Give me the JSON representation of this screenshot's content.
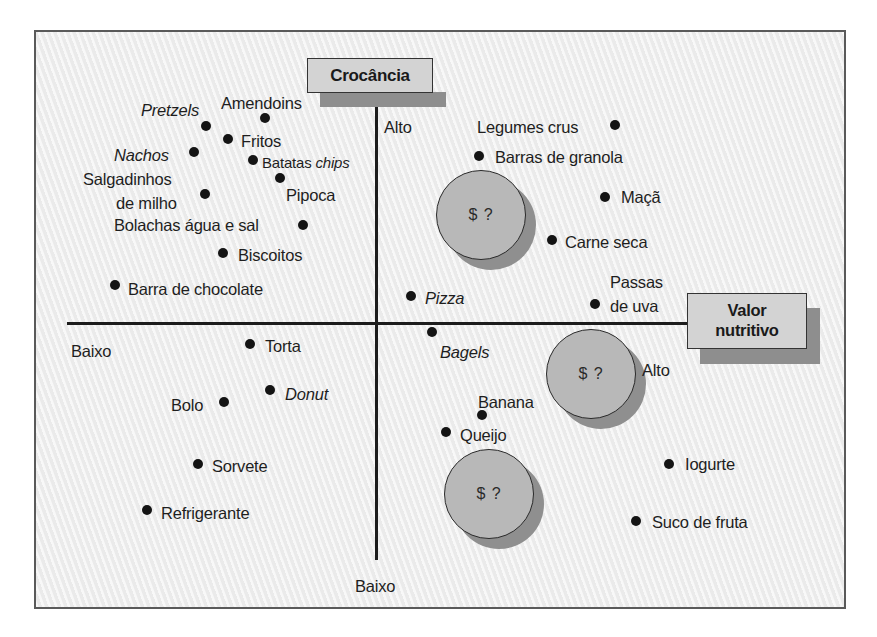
{
  "diagram": {
    "type": "perceptual-map",
    "axes": {
      "vertical": {
        "title": "Crocância",
        "high_label": "Alto",
        "low_label": "Baixo"
      },
      "horizontal": {
        "title": "Valor nutritivo",
        "title_line1": "Valor",
        "title_line2": "nutritivo",
        "high_label": "Alto",
        "low_label": "Baixo"
      }
    },
    "opportunity_bubbles": [
      {
        "label": "$ ?",
        "quadrant": "alta crocância / alto valor nutritivo"
      },
      {
        "label": "$ ?",
        "quadrant": "baixa crocância / alto valor nutritivo"
      },
      {
        "label": "$ ?",
        "quadrant": "baixa crocância / alto valor nutritivo"
      }
    ],
    "items": [
      {
        "label": "Pretzels",
        "italic": true
      },
      {
        "label": "Amendoins",
        "italic": false
      },
      {
        "label": "Fritos",
        "italic": false
      },
      {
        "label": "Nachos",
        "italic": true
      },
      {
        "label_prefix": "Batatas ",
        "label_suffix": "chips",
        "label": "Batatas chips",
        "italic": false
      },
      {
        "label": "Pipoca",
        "italic": false
      },
      {
        "label_line1": "Salgadinhos",
        "label_line2": "de milho",
        "label": "Salgadinhos de milho",
        "italic": false
      },
      {
        "label": "Bolachas água e sal",
        "italic": false
      },
      {
        "label": "Biscoitos",
        "italic": false
      },
      {
        "label": "Barra de chocolate",
        "italic": false
      },
      {
        "label": "Legumes crus",
        "italic": false
      },
      {
        "label": "Barras de granola",
        "italic": false
      },
      {
        "label": "Maçã",
        "italic": false
      },
      {
        "label": "Carne seca",
        "italic": false
      },
      {
        "label_line1": "Passas",
        "label_line2": "de uva",
        "label": "Passas de uva",
        "italic": false
      },
      {
        "label": "Pizza",
        "italic": true
      },
      {
        "label": "Bagels",
        "italic": true
      },
      {
        "label": "Torta",
        "italic": false
      },
      {
        "label": "Donut",
        "italic": true
      },
      {
        "label": "Bolo",
        "italic": false
      },
      {
        "label": "Sorvete",
        "italic": false
      },
      {
        "label": "Refrigerante",
        "italic": false
      },
      {
        "label": "Banana",
        "italic": false
      },
      {
        "label": "Queijo",
        "italic": false
      },
      {
        "label": "Iogurte",
        "italic": false
      },
      {
        "label": "Suco de fruta",
        "italic": false
      }
    ],
    "colors": {
      "background": "#efefef",
      "label_box": "#d3d3d3",
      "label_shadow": "#8e8e8e",
      "bubble": "#b8b8b8",
      "bubble_shadow": "#8f8f8f",
      "ink": "#1c1c1c"
    }
  }
}
